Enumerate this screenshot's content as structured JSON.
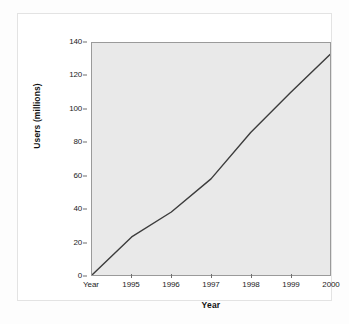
{
  "chart_data": {
    "type": "line",
    "title": "",
    "xlabel": "Year",
    "ylabel": "Users (millions)",
    "x": [
      "Year",
      "1995",
      "1996",
      "1997",
      "1998",
      "1999",
      "2000"
    ],
    "categories": [
      "Year",
      "1995",
      "1996",
      "1997",
      "1998",
      "1999",
      "2000"
    ],
    "values": [
      0,
      23,
      38,
      58,
      86,
      110,
      133
    ],
    "series": [
      {
        "name": "Users (millions)",
        "values": [
          0,
          23,
          38,
          58,
          86,
          110,
          133
        ]
      }
    ],
    "xtick_labels": [
      "Year",
      "1995",
      "1996",
      "1997",
      "1998",
      "1999",
      "2000"
    ],
    "ytick_labels": [
      "0",
      "20",
      "40",
      "60",
      "80",
      "100",
      "120",
      "140"
    ],
    "ytick_values": [
      0,
      20,
      40,
      60,
      80,
      100,
      120,
      140
    ],
    "ylim": [
      0,
      140
    ],
    "xlim": [
      0,
      6
    ],
    "grid": false,
    "legend": false,
    "legend_position": "none",
    "line_color": "#3c3c3c",
    "plot_background": "#e9e9e9",
    "axis_color": "#9a9a9a",
    "figure_background": "#ffffff"
  }
}
